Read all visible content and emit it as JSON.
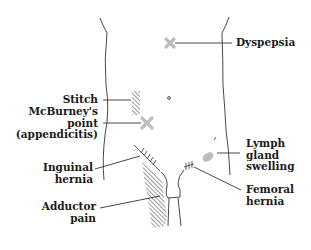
{
  "colors": {
    "outline": "#333333",
    "hatch": "#444444",
    "marker": "#bdbdbd",
    "text": "#1a1a1a",
    "background": "#ffffff"
  },
  "labels": {
    "dyspepsia": "Dyspepsia",
    "stitch": "Stitch",
    "mcburney": "McBurney's\npoint\n(appendicitis)",
    "inguinal": "Inguinal\nhernia",
    "adductor": "Adductor\npain",
    "lymph": "Lymph\ngland\nswelling",
    "femoral": "Femoral\nhernia"
  },
  "markers": [
    {
      "name": "dyspepsia-marker",
      "type": "cross",
      "x": 170,
      "y": 43
    },
    {
      "name": "mcburney-marker",
      "type": "cross",
      "x": 147,
      "y": 123
    },
    {
      "name": "lymph-gland-marker",
      "type": "blob",
      "x": 207,
      "y": 156
    },
    {
      "name": "umbilicus",
      "type": "dot",
      "x": 169,
      "y": 98
    }
  ]
}
